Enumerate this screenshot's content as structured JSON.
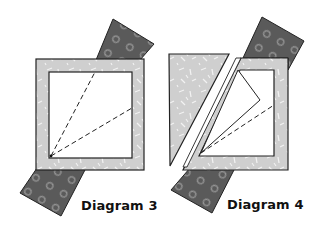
{
  "diagrams": [
    {
      "id": "3",
      "label": "Diagram 3"
    },
    {
      "id": "4",
      "label": "Diagram 4"
    }
  ],
  "colors": {
    "background": "#ffffff",
    "dark_fabric": "#5a5a5a",
    "dark_fabric_dots": "#9a9a9a",
    "light_fabric": "#cfcfcf",
    "light_fabric_marks": "#f2f2f2",
    "outline": "#222222",
    "inner_window": "#ffffff",
    "dashed_line": "#222222"
  }
}
